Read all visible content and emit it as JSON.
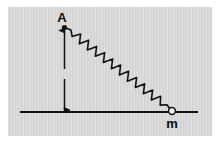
{
  "figure": {
    "type": "physics-diagram",
    "canvas": {
      "width": 216,
      "height": 143,
      "background_color": "#ffffff"
    },
    "panel": {
      "x": 8,
      "y": 7,
      "width": 204,
      "height": 129,
      "fill_color": "#d9d9d9",
      "texture": "faint-vertical-scanlines"
    },
    "ink_color": "#121212",
    "labels": [
      {
        "name": "point-a",
        "text": "A",
        "x": 62,
        "y": 22,
        "font_size": 13
      },
      {
        "name": "mass-m",
        "text": "m",
        "x": 172,
        "y": 128,
        "font_size": 13
      }
    ],
    "anchor_point": {
      "name": "A",
      "x": 64.5,
      "y": 27.5,
      "radius": 2.6
    },
    "mass_marker": {
      "name": "m",
      "x": 172,
      "y": 111,
      "radius": 3.4,
      "style": "open-circle"
    },
    "ground_line": {
      "x1": 20,
      "y1": 112,
      "x2": 198,
      "y2": 112,
      "stroke_width": 2.1
    },
    "height_arrow": {
      "x": 64.5,
      "y_top": 29,
      "y_bottom": 112,
      "stroke_width": 1.5,
      "arrowheads": "both",
      "gap": {
        "y_start": 69,
        "y_end": 79
      }
    },
    "spring": {
      "start_x": 66,
      "start_y": 28,
      "end_x": 170,
      "end_y": 109,
      "coils": 13,
      "amplitude": 4.3,
      "stroke_width": 1.6
    }
  }
}
